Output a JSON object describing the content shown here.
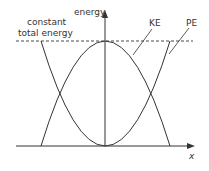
{
  "diagram": {
    "y_axis_label": "energy",
    "x_axis_label": "x",
    "annotation_total": [
      "constant",
      "total energy"
    ],
    "curve_labels": {
      "ke": "KE",
      "pe": "PE"
    },
    "colors": {
      "line": "#333333",
      "background": "#ffffff"
    }
  }
}
